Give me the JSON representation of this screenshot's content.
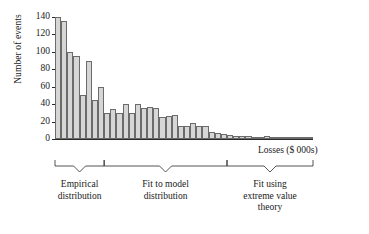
{
  "chart_data": {
    "type": "bar",
    "title": "",
    "subtitle": "",
    "xlabel": "Losses ($ 000s)",
    "ylabel": "Number of events",
    "ylim": [
      0,
      140
    ],
    "yticks": [
      0,
      20,
      40,
      60,
      80,
      100,
      120,
      140
    ],
    "ytick_labels": [
      "0",
      "20",
      "40",
      "60",
      "80",
      "100",
      "120",
      "140"
    ],
    "xticks": [],
    "xtick_labels": [],
    "grid": false,
    "legend": null,
    "bar_color": "#d6d6d6",
    "bar_edge_color": "#6b6b6b",
    "axis_color": "#2a2a2a",
    "n_bins": 42,
    "categories": [
      "1",
      "2",
      "3",
      "4",
      "5",
      "6",
      "7",
      "8",
      "9",
      "10",
      "11",
      "12",
      "13",
      "14",
      "15",
      "16",
      "17",
      "18",
      "19",
      "20",
      "21",
      "22",
      "23",
      "24",
      "25",
      "26",
      "27",
      "28",
      "29",
      "30",
      "31",
      "32",
      "33",
      "34",
      "35",
      "36",
      "37",
      "38",
      "39",
      "40",
      "41",
      "42"
    ],
    "values": [
      140,
      135,
      100,
      95,
      50,
      90,
      45,
      60,
      30,
      35,
      30,
      40,
      30,
      40,
      36,
      37,
      36,
      25,
      26,
      27,
      15,
      15,
      18,
      15,
      15,
      8,
      7,
      6,
      5,
      4,
      3,
      3,
      2,
      2,
      3,
      2,
      2,
      2,
      1,
      1,
      1,
      1
    ],
    "annotations": [
      {
        "label": "Empirical\ndistribution",
        "bracket_start_bin": 1,
        "bracket_end_bin": 8
      },
      {
        "label": "Fit to model\ndistribution",
        "bracket_start_bin": 9,
        "bracket_end_bin": 28
      },
      {
        "label": "Fit using\nextreme value\ntheory",
        "bracket_start_bin": 29,
        "bracket_end_bin": 42
      }
    ]
  },
  "axes": {
    "ylabel": "Number of events",
    "xlabel": "Losses ($ 000s)",
    "ytick_labels": [
      "140",
      "120",
      "100",
      "80",
      "60",
      "40",
      "20",
      "0"
    ]
  },
  "regions": [
    {
      "caption": "Empirical\ndistribution"
    },
    {
      "caption": "Fit to model\ndistribution"
    },
    {
      "caption": "Fit using\nextreme value\ntheory"
    }
  ]
}
